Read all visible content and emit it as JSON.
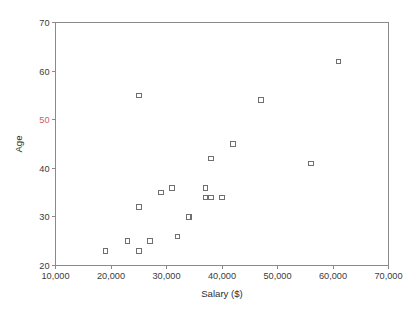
{
  "chart_data": {
    "type": "scatter",
    "title": "",
    "xlabel": "Salary ($)",
    "ylabel": "Age",
    "xlim": [
      10000,
      70000
    ],
    "ylim": [
      20,
      70
    ],
    "grid": false,
    "legend": null,
    "x_ticks": [
      10000,
      20000,
      30000,
      40000,
      50000,
      60000,
      70000
    ],
    "x_tick_labels": [
      "10,000",
      "20,000",
      "30,000",
      "40,000",
      "50,000",
      "60,000",
      "70,000"
    ],
    "y_ticks": [
      20,
      30,
      40,
      50,
      60,
      70
    ],
    "y_tick_labels": [
      "20",
      "30",
      "40",
      "50",
      "60",
      "70"
    ],
    "marker_style": "open-square",
    "marker_color": "#6f6f6f",
    "series": [
      {
        "name": "observations",
        "points": [
          {
            "x": 19000,
            "y": 23
          },
          {
            "x": 23000,
            "y": 25
          },
          {
            "x": 25000,
            "y": 23
          },
          {
            "x": 25000,
            "y": 32
          },
          {
            "x": 25000,
            "y": 55
          },
          {
            "x": 27000,
            "y": 25
          },
          {
            "x": 29000,
            "y": 35
          },
          {
            "x": 31000,
            "y": 36
          },
          {
            "x": 32000,
            "y": 26
          },
          {
            "x": 34000,
            "y": 30
          },
          {
            "x": 37000,
            "y": 36
          },
          {
            "x": 37000,
            "y": 34
          },
          {
            "x": 38000,
            "y": 34
          },
          {
            "x": 38000,
            "y": 42
          },
          {
            "x": 40000,
            "y": 34
          },
          {
            "x": 42000,
            "y": 45
          },
          {
            "x": 47000,
            "y": 54
          },
          {
            "x": 56000,
            "y": 41
          },
          {
            "x": 61000,
            "y": 62
          }
        ]
      }
    ]
  },
  "axes": {
    "x_title": "Salary ($)",
    "y_title": "Age"
  }
}
